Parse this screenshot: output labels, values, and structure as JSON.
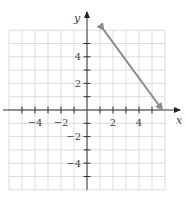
{
  "chart_data": {
    "type": "line",
    "title": "",
    "xlabel": "x",
    "ylabel": "y",
    "xlim": [
      -6,
      6
    ],
    "ylim": [
      -6,
      6
    ],
    "grid": true,
    "x_ticks": [
      -4,
      -2,
      2,
      4
    ],
    "y_ticks": [
      4,
      2,
      -2,
      -4
    ],
    "x_tick_labels": [
      "−4",
      "−2",
      "2",
      "4"
    ],
    "y_tick_labels": [
      "4",
      "2",
      "−2",
      "−4"
    ],
    "series": [
      {
        "name": "line",
        "x": [
          1.3,
          5.8
        ],
        "y": [
          6.0,
          0.0
        ],
        "arrows": "both",
        "color": "#8c8c8c"
      }
    ]
  }
}
